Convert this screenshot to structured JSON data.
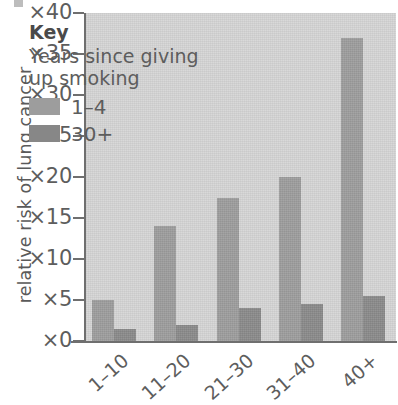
{
  "chart_data": {
    "type": "bar",
    "title": "",
    "xlabel": "",
    "ylabel": "relative risk of lung cancer",
    "categories": [
      "1–10",
      "11–20",
      "21–30",
      "31–40",
      "40+"
    ],
    "series": [
      {
        "name": "1–4",
        "color": "#9d9d9d",
        "values": [
          5,
          14,
          17.5,
          20,
          37
        ]
      },
      {
        "name": "30+",
        "color": "#8a8a8a",
        "values": [
          1.5,
          2,
          4,
          4.5,
          5.5
        ]
      }
    ],
    "ylim": [
      0,
      40
    ],
    "ytick_values": [
      0,
      5,
      10,
      15,
      20,
      25,
      30,
      35,
      40
    ],
    "ytick_labels": [
      "×0",
      "×5",
      "×10",
      "×15",
      "×20",
      "×25",
      "×30",
      "×35",
      "×40"
    ],
    "grid": false,
    "legend_position": "inside-top-left",
    "legend_title": "Key",
    "legend_subtitle": "Years since giving up smoking"
  },
  "key": {
    "title": "Key",
    "subtitle": "Years since giving up smoking",
    "entries": [
      {
        "label": "1–4",
        "color": "#9d9d9d"
      },
      {
        "label": "30+",
        "color": "#878787"
      }
    ]
  },
  "axes": {
    "y_title": "relative risk of lung cancer",
    "y_ticks": [
      "×40",
      "×35",
      "×30",
      "×25",
      "×20",
      "×15",
      "×10",
      "×5",
      "×0"
    ],
    "x_ticks": [
      "1–10",
      "11–20",
      "21–30",
      "31–40",
      "40+"
    ]
  },
  "colors": {
    "plot_background": "#d6d6d6",
    "axis": "#6f6f6f",
    "text": "#5d5d5d",
    "series_light": "#9d9d9d",
    "series_dark": "#8a8a8a"
  }
}
